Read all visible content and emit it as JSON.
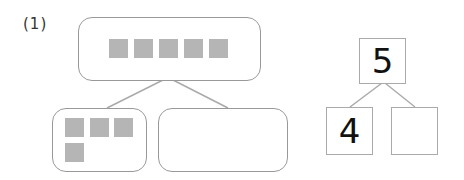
{
  "problem": {
    "label": "(1)"
  },
  "left_diagram": {
    "whole_count": 5,
    "part_a_count": 4,
    "part_b_count": null
  },
  "number_bond": {
    "whole": "5",
    "part_a": "4",
    "part_b": ""
  },
  "colors": {
    "square_fill": "#b5b5b5",
    "box_border": "#999999",
    "line": "#aaaaaa"
  }
}
